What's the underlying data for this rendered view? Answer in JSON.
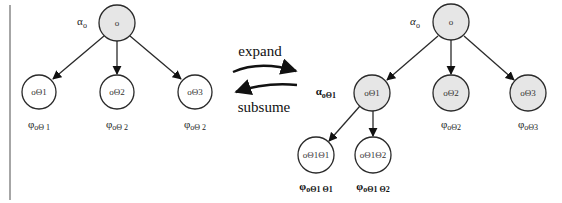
{
  "colors": {
    "stroke": "#2a2a2a",
    "filled_node": "#e6e6e6",
    "empty_node": "#ffffff",
    "divider": "#888888"
  },
  "left_tree": {
    "root": {
      "text": "o",
      "alpha_label": "α",
      "alpha_sub": "o",
      "filled": true
    },
    "children": [
      {
        "text": "oΘ1",
        "phi_label": "φ",
        "phi_sub": "oΘ 1",
        "filled": false
      },
      {
        "text": "oΘ2",
        "phi_label": "φ",
        "phi_sub": "oΘ 2",
        "filled": false
      },
      {
        "text": "oΘ3",
        "phi_label": "φ",
        "phi_sub": "oΘ 2",
        "filled": false
      }
    ]
  },
  "operations": {
    "expand": "expand",
    "subsume": "subsume"
  },
  "right_tree": {
    "root": {
      "text": "o",
      "alpha_label": "α",
      "alpha_sub": "o",
      "filled": true
    },
    "children": [
      {
        "text": "oΘ1",
        "alpha_label": "α",
        "alpha_sub": "oΘ1",
        "filled": true
      },
      {
        "text": "oΘ2",
        "phi_label": "φ",
        "phi_sub": "oΘ2",
        "filled": true
      },
      {
        "text": "oΘ3",
        "phi_label": "φ",
        "phi_sub": "oΘ3",
        "filled": true
      }
    ],
    "grandchildren": [
      {
        "text": "oΘ1Θ1",
        "phi_label": "φ",
        "phi_sub": "oΘ1 Θ1",
        "filled": false
      },
      {
        "text": "oΘ1Θ2",
        "phi_label": "φ",
        "phi_sub": "oΘ1 Θ2",
        "filled": false
      }
    ]
  }
}
